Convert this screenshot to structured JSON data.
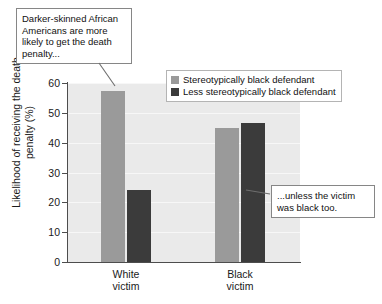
{
  "chart_data": {
    "type": "bar",
    "title": "",
    "subtitle": "",
    "xlabel": "",
    "ylabel": "Likelihood of receiving the death penalty (%)",
    "categories": [
      "White victim",
      "Black victim"
    ],
    "category_lines": [
      [
        "White",
        "victim"
      ],
      [
        "Black",
        "victim"
      ]
    ],
    "series": [
      {
        "name": "Stereotypically black defendant",
        "color": "#9a9a9a",
        "values": [
          57.5,
          45.0
        ]
      },
      {
        "name": "Less stereotypically black defendant",
        "color": "#3b3b3b",
        "values": [
          24.0,
          46.5
        ]
      }
    ],
    "ylim": [
      0,
      60
    ],
    "yticks": [
      0,
      10,
      20,
      30,
      40,
      50,
      60
    ],
    "ytick_labels": [
      "0",
      "10",
      "20",
      "30",
      "40",
      "50",
      "60"
    ],
    "grid": true,
    "grid_axis": "y",
    "legend_position": "top-right",
    "plot_background": "#eaeaea",
    "annotations": [
      {
        "id": "callout-top",
        "text": "Darker-skinned African Americans are more likely to get the death penalty...",
        "points_to": "White victim / Stereotypically black defendant bar"
      },
      {
        "id": "callout-right",
        "text": "...unless the victim was black too.",
        "points_to": "Black victim / Less stereotypically black defendant bar"
      }
    ]
  },
  "axis": {
    "y_title": "Likelihood of receiving the death penalty (%)"
  },
  "legend": {
    "entries": [
      {
        "label": "Stereotypically black defendant"
      },
      {
        "label": "Less stereotypically black defendant"
      }
    ]
  },
  "callouts": {
    "top": "Darker-skinned African Americans are more likely to get the death penalty...",
    "right": "...unless the victim was black too."
  }
}
